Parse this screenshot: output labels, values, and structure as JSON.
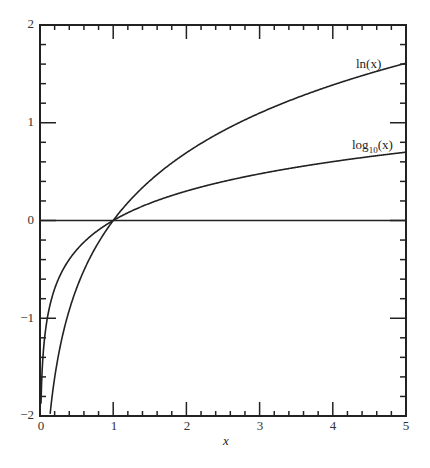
{
  "chart_data": {
    "type": "line",
    "title": "",
    "xlabel": "x",
    "ylabel": "",
    "xlim": [
      0,
      5
    ],
    "ylim": [
      -2,
      2
    ],
    "grid": false,
    "x_ticks": [
      "0",
      "1",
      "2",
      "3",
      "4",
      "5"
    ],
    "y_ticks": [
      "-2",
      "-1",
      "0",
      "1",
      "2"
    ],
    "series": [
      {
        "name": "ln(x)",
        "function": "ln(x)",
        "x": [
          0.135,
          0.25,
          0.5,
          1,
          1.5,
          2,
          2.5,
          3,
          3.5,
          4,
          4.5,
          5
        ],
        "values": [
          -2.0,
          -1.386,
          -0.693,
          0,
          0.405,
          0.693,
          0.916,
          1.099,
          1.253,
          1.386,
          1.504,
          1.609
        ]
      },
      {
        "name": "log10(x)",
        "function": "log10(x)",
        "x": [
          0.01,
          0.05,
          0.1,
          0.25,
          0.5,
          1,
          1.5,
          2,
          2.5,
          3,
          3.5,
          4,
          4.5,
          5
        ],
        "values": [
          -2.0,
          -1.301,
          -1.0,
          -0.602,
          -0.301,
          0,
          0.176,
          0.301,
          0.398,
          0.477,
          0.544,
          0.602,
          0.653,
          0.699
        ]
      },
      {
        "name": "y=0",
        "function": "0",
        "x": [
          0,
          5
        ],
        "values": [
          0,
          0
        ]
      }
    ],
    "annotations": [
      {
        "text": "ln(x)",
        "x": 4.5,
        "y": 1.75
      },
      {
        "text": "log10(x)",
        "x": 4.5,
        "y": 0.85
      }
    ]
  },
  "labels": {
    "xlabel": "x",
    "ln": "ln(x)",
    "log_prefix": "log",
    "log_sub": "10",
    "log_suffix": "(x)",
    "yticks": [
      "2",
      "1",
      "0",
      "−1",
      "−2"
    ],
    "xticks": [
      "0",
      "1",
      "2",
      "3",
      "4",
      "5"
    ]
  }
}
